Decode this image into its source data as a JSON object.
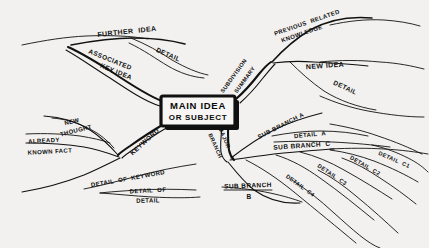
{
  "diagram": {
    "type": "mind-map",
    "background_color": "#f2f1ef",
    "ink_color": "#111111",
    "center_node": {
      "line1": "MAIN IDEA",
      "line2": "OR SUBJECT",
      "shape": "rectangle-with-drop-shadow"
    },
    "branches": [
      {
        "id": "further-idea",
        "label": "FURTHER  IDEA",
        "side": "upper-left",
        "level": 2,
        "children": [
          {
            "id": "further-idea-detail",
            "label": "DETAIL",
            "level": 3
          }
        ]
      },
      {
        "id": "associated-key-idea",
        "label_line1": "ASSOCIATED",
        "label_line2": "KEY IDEA",
        "side": "upper-left",
        "level": 1,
        "children": []
      },
      {
        "id": "subdivision-summary",
        "label_line1": "SUBDIVISION",
        "label_line2": "SUMMARY",
        "side": "upper-right",
        "level": 1,
        "children": [
          {
            "id": "previous-related-knowledge",
            "label_line1": "PREVIOUS  RELATED",
            "label_line2": "KNOWLEDGE",
            "level": 2
          },
          {
            "id": "new-idea",
            "label": "NEW IDEA",
            "level": 2,
            "children": [
              {
                "id": "new-idea-detail",
                "label": "DETAIL",
                "level": 3
              }
            ]
          }
        ]
      },
      {
        "id": "keyword",
        "label": "KEYWORD",
        "side": "lower-left",
        "level": 1,
        "children": [
          {
            "id": "new-thought",
            "label_line1": "NEW",
            "label_line2": "THOUGHT",
            "level": 2
          },
          {
            "id": "already-known-fact",
            "label_line1": "ALREADY",
            "label_line2": "KNOWN FACT",
            "level": 2
          },
          {
            "id": "detail-of-keyword",
            "label": "DETAIL  OF  KEYWORD",
            "level": 2,
            "children": [
              {
                "id": "detail-of-detail",
                "label_line1": "DETAIL  OF",
                "label_line2": "DETAIL",
                "level": 3
              }
            ]
          }
        ]
      },
      {
        "id": "major-branch",
        "label_line1": "MAJOR",
        "label_line2": "BRANCH",
        "side": "lower-right",
        "level": 1,
        "children": [
          {
            "id": "sub-branch-a",
            "label": "SUB BRANCH A",
            "level": 2,
            "children": [
              {
                "id": "detail-a",
                "label": "DETAIL  A",
                "level": 3
              }
            ]
          },
          {
            "id": "sub-branch-c",
            "label": "SUB BRANCH  C",
            "level": 2,
            "children": [
              {
                "id": "detail-c1",
                "label": "DETAIL  C1",
                "level": 3
              },
              {
                "id": "detail-c2",
                "label": "DETAIL  C2",
                "level": 3
              },
              {
                "id": "detail-c3",
                "label": "DETAIL  C3",
                "level": 3
              },
              {
                "id": "detail-c4",
                "label": "DETAIL  C4",
                "level": 3
              }
            ]
          },
          {
            "id": "sub-branch-b",
            "label_line1": "SUB BRANCH",
            "label_line2": "B",
            "level": 2
          }
        ]
      }
    ],
    "labels": {
      "further_idea": "FURTHER  IDEA",
      "further_idea_detail": "DETAIL",
      "associated_1": "ASSOCIATED",
      "associated_2": "KEY IDEA",
      "previous_1": "PREVIOUS  RELATED",
      "previous_2": "KNOWLEDGE",
      "subdivision": "SUBDIVISION",
      "summary": "SUMMARY",
      "new_idea": "NEW IDEA",
      "new_idea_detail": "DETAIL",
      "new_thought_1": "NEW",
      "new_thought_2": "THOUGHT",
      "already_1": "ALREADY",
      "already_2": "KNOWN FACT",
      "keyword": "KEYWORD",
      "detail_of_keyword": "DETAIL  OF  KEYWORD",
      "detail_of_detail_1": "DETAIL  OF",
      "detail_of_detail_2": "DETAIL",
      "major_1": "MAJOR",
      "major_2": "BRANCH",
      "sub_branch_a": "SUB BRANCH A",
      "detail_a": "DETAIL  A",
      "sub_branch_c": "SUB BRANCH  C",
      "detail_c1": "DETAIL  C1",
      "detail_c2": "DETAIL  C2",
      "detail_c3": "DETAIL  C3",
      "detail_c4": "DETAIL  C4",
      "sub_branch_b_1": "SUB BRANCH",
      "sub_branch_b_2": "B"
    }
  }
}
